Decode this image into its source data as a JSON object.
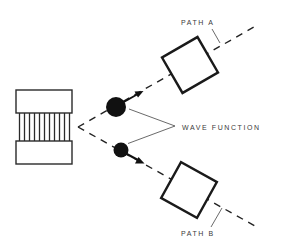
{
  "diagram": {
    "type": "quantum-double-path",
    "labels": {
      "path_a": "PATH A",
      "path_b": "PATH B",
      "wave_function": "WAVE FUNCTION"
    },
    "source": {
      "name": "emitter",
      "slit_count": 11
    },
    "paths": [
      {
        "id": "a",
        "label": "PATH A",
        "direction": "up-right",
        "particle": "large-ball"
      },
      {
        "id": "b",
        "label": "PATH B",
        "direction": "down-right",
        "particle": "small-ball"
      }
    ],
    "colors": {
      "line": "#222222",
      "ball": "#111111",
      "text": "#3a3a3a",
      "background": "#ffffff"
    }
  }
}
